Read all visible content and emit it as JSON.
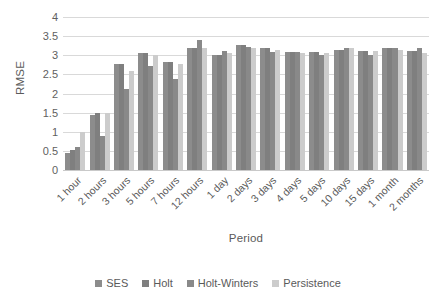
{
  "chart_data": {
    "type": "bar",
    "title": "",
    "xlabel": "Period",
    "ylabel": "RMSE",
    "ylim": [
      0,
      4
    ],
    "yticks": [
      0,
      0.5,
      1,
      1.5,
      2,
      2.5,
      3,
      3.5,
      4
    ],
    "ytick_labels": [
      "0",
      "0.5",
      "1",
      "1.5",
      "2",
      "2.5",
      "3",
      "3.5",
      "4"
    ],
    "grid": true,
    "legend_position": "bottom",
    "categories": [
      "1 hour",
      "2 hours",
      "3 hours",
      "5 hours",
      "7 hours",
      "12 hours",
      "1 day",
      "2 days",
      "3 days",
      "4 days",
      "5 days",
      "10 days",
      "15 days",
      "1 month",
      "2 months"
    ],
    "series": [
      {
        "name": "SES",
        "color": "#8c8c8c",
        "values": [
          0.45,
          1.45,
          2.78,
          3.05,
          2.82,
          3.18,
          3.02,
          3.28,
          3.18,
          3.08,
          3.08,
          3.15,
          3.12,
          3.18,
          3.12
        ]
      },
      {
        "name": "Holt",
        "color": "#7f7f7f",
        "values": [
          0.52,
          1.5,
          2.78,
          3.05,
          2.82,
          3.18,
          3.02,
          3.28,
          3.18,
          3.08,
          3.08,
          3.15,
          3.12,
          3.18,
          3.12
        ]
      },
      {
        "name": "Holt-Winters",
        "color": "#898989",
        "values": [
          0.6,
          0.9,
          2.12,
          2.72,
          2.38,
          3.4,
          3.12,
          3.22,
          3.08,
          3.08,
          3.02,
          3.2,
          3.02,
          3.2,
          3.18
        ]
      },
      {
        "name": "Persistence",
        "color": "#cccccc",
        "values": [
          1.0,
          1.5,
          2.6,
          3.0,
          2.78,
          3.18,
          3.05,
          3.2,
          3.15,
          3.05,
          3.05,
          3.18,
          3.1,
          3.15,
          3.05
        ]
      }
    ]
  }
}
